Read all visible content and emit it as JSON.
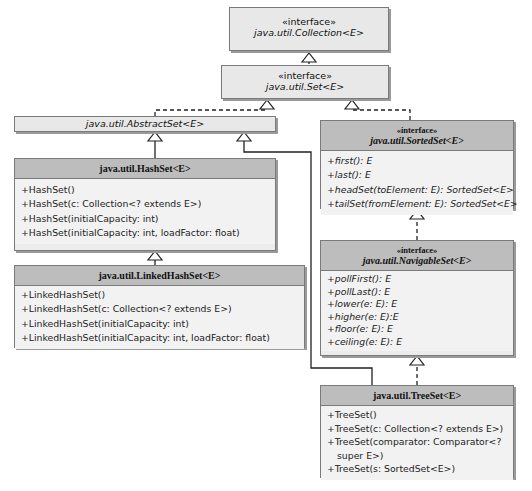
{
  "diagram": {
    "type": "uml-class-diagram",
    "colors": {
      "header_fill": "#bdbdbd",
      "body_fill": "#f2f2f2",
      "border": "#7a7a7a",
      "line": "#222222"
    },
    "collection": {
      "stereotype": "«interface»",
      "name": "java.util.Collection<E>"
    },
    "set": {
      "stereotype": "«interface»",
      "name": "java.util.Set<E>"
    },
    "abstract_set": {
      "name": "java.util.AbstractSet<E>"
    },
    "sorted_set": {
      "stereotype": "«interface»",
      "name": "java.util.SortedSet<E>",
      "methods": [
        "+first(): E",
        "+last(): E",
        "+headSet(toElement: E): SortedSet<E>",
        "+tailSet(fromElement: E): SortedSet<E>"
      ]
    },
    "hash_set": {
      "name": "java.util.HashSet<E>",
      "methods": [
        "+HashSet()",
        "+HashSet(c: Collection<? extends E>)",
        "+HashSet(initialCapacity: int)",
        "+HashSet(initialCapacity: int, loadFactor: float)"
      ]
    },
    "linked_hash_set": {
      "name": "java.util.LinkedHashSet<E>",
      "methods": [
        "+LinkedHashSet()",
        "+LinkedHashSet(c: Collection<? extends E>)",
        "+LinkedHashSet(initialCapacity: int)",
        "+LinkedHashSet(initialCapacity: int, loadFactor: float)"
      ]
    },
    "navigable_set": {
      "stereotype": "«interface»",
      "name": "java.util.NavigableSet<E>",
      "methods": [
        "+pollFirst(): E",
        "+pollLast(): E",
        "+lower(e: E): E",
        "+higher(e: E):E",
        "+floor(e: E): E",
        "+ceiling(e: E): E"
      ]
    },
    "tree_set": {
      "name": "java.util.TreeSet<E>",
      "methods": [
        "+TreeSet()",
        "+TreeSet(c: Collection<? extends E>)",
        "+TreeSet(comparator: Comparator<?",
        "super E>)",
        "+TreeSet(s: SortedSet<E>)"
      ]
    }
  }
}
